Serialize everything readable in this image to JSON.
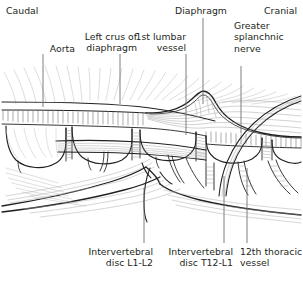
{
  "figure": {
    "orientation": {
      "caudal_label": "Caudal",
      "cranial_label": "Cranial"
    },
    "line_color": "#231f20",
    "hatch_color": "#8a8a8a",
    "leader_color": "#6f6f6f",
    "background": "#ffffff"
  },
  "labels": {
    "caudal": "Caudal",
    "cranial": "Cranial",
    "aorta": "Aorta",
    "left_crus": "Left crus of\ndiaphragm",
    "first_lumbar_vessel": "1st lumbar\nvessel",
    "diaphragm": "Diaphragm",
    "greater_splanchnic_nerve": "Greater\nsplanchnic\nnerve",
    "disc_l1_l2": "Intervertebral\ndisc L1-L2",
    "disc_t12_l1": "Intervertebral\ndisc T12-L1",
    "twelfth_thoracic_vessel": "12th thoracic\nvessel"
  },
  "leaders": [
    {
      "name": "aorta-leader",
      "x": 43,
      "y1": 54,
      "y2": 107
    },
    {
      "name": "left-crus-leader",
      "x": 120,
      "y1": 54,
      "y2": 104
    },
    {
      "name": "first-lumbar-vessel-leader",
      "x": 186,
      "y1": 54,
      "y2": 135
    },
    {
      "name": "diaphragm-leader",
      "x": 203,
      "y1": 18,
      "y2": 104
    },
    {
      "name": "greater-splanchnic-nerve-leader",
      "x": 241,
      "y1": 66,
      "y2": 133
    },
    {
      "name": "disc-l1-l2-leader",
      "x": 144,
      "y1": 188,
      "y2": 243
    },
    {
      "name": "disc-t12-l1-leader",
      "x": 224,
      "y1": 176,
      "y2": 243
    },
    {
      "name": "twelfth-thoracic-vessel-leader",
      "x": 247,
      "y1": 168,
      "y2": 243
    }
  ]
}
